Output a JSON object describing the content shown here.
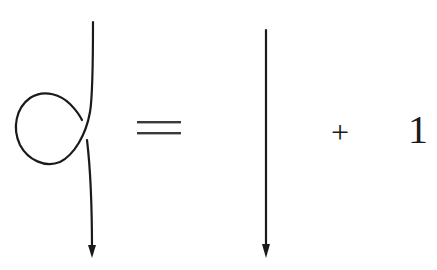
{
  "diagram": {
    "type": "knot-skein-relation",
    "lhs": {
      "label": "strand with kink (curl)",
      "orientation": "downward",
      "icon": "kinked-strand-icon"
    },
    "relation_symbol": "=",
    "rhs_terms": [
      {
        "label": "straight strand",
        "orientation": "downward",
        "icon": "straight-strand-icon"
      },
      {
        "operator": "+"
      },
      {
        "constant": "1"
      }
    ]
  },
  "text": {
    "equals": "=",
    "plus": "+",
    "one": "1"
  },
  "colors": {
    "ink": "#1a1a1a",
    "background": "#ffffff"
  }
}
